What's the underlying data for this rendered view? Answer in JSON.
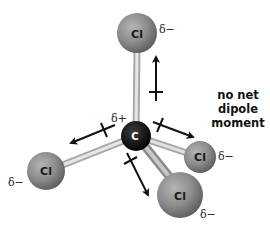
{
  "diagram": {
    "central_atom": {
      "symbol": "C",
      "charge": "δ+"
    },
    "atoms": [
      {
        "id": "top",
        "symbol": "Cl",
        "charge": "δ−"
      },
      {
        "id": "right",
        "symbol": "Cl",
        "charge": "δ−"
      },
      {
        "id": "bottom",
        "symbol": "Cl",
        "charge": "δ−"
      },
      {
        "id": "left",
        "symbol": "Cl",
        "charge": "δ−"
      }
    ],
    "note": {
      "line1": "no net",
      "line2": "dipole",
      "line3": "moment"
    },
    "colors": {
      "chlorine": "#8a8a8a",
      "carbon": "#111111",
      "bond": "#c8c8c8",
      "arrow": "#111111"
    }
  }
}
